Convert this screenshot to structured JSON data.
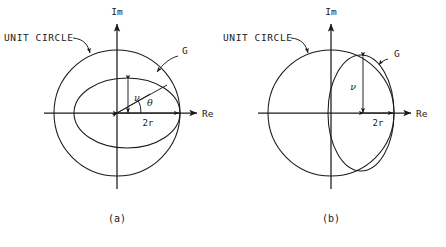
{
  "figure": {
    "background": "#ffffff",
    "ink_color": "#1a1a1a",
    "width": 446,
    "height": 247
  },
  "panels": [
    {
      "id": "a",
      "caption": "(a)",
      "unit_circle_label": "UNIT CIRCLE",
      "curve_label": "G",
      "axis_real_label": "Re",
      "axis_imag_label": "Im",
      "dim_horizontal_label": "2r",
      "dim_vertical_label": "ν",
      "angle_label": "θ",
      "shape": "wide ellipse inscribed in unit circle, tangent at right",
      "center": {
        "x": 117,
        "y": 113
      },
      "unit_circle_radius": 63,
      "ellipse": {
        "cx": 127,
        "cy": 113,
        "rx": 53,
        "ry": 35
      }
    },
    {
      "id": "b",
      "caption": "(b)",
      "unit_circle_label": "UNIT CIRCLE",
      "curve_label": "G",
      "axis_real_label": "Re",
      "axis_imag_label": "Im",
      "dim_horizontal_label": "2r",
      "dim_vertical_label": "ν",
      "shape": "tall narrow ellipse inscribed in unit circle, tangent at right",
      "center": {
        "x": 331,
        "y": 113
      },
      "unit_circle_radius": 63,
      "ellipse": {
        "cx": 361,
        "cy": 113,
        "rx": 33,
        "ry": 58
      }
    }
  ],
  "footer": {
    "text": ""
  }
}
